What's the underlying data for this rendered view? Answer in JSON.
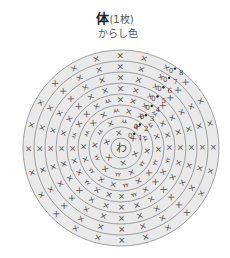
{
  "header": {
    "title": "体",
    "count": "(1枚)",
    "color_name": "からし色"
  },
  "diagram": {
    "type": "crochet-round-chart",
    "center": {
      "x": 121,
      "y": 148
    },
    "center_label": "わ",
    "center_radius": 10,
    "ring_width": 11,
    "rounds": [
      {
        "round": 1,
        "stitch_count": 6,
        "increase_symbols": 0
      },
      {
        "round": 2,
        "stitch_count": 12,
        "increase_symbols": 6
      },
      {
        "round": 3,
        "stitch_count": 18,
        "increase_symbols": 6
      },
      {
        "round": 4,
        "stitch_count": 24,
        "increase_symbols": 6
      },
      {
        "round": 5,
        "stitch_count": 24,
        "increase_symbols": 0
      },
      {
        "round": 6,
        "stitch_count": 24,
        "increase_symbols": 0
      },
      {
        "round": 7,
        "stitch_count": 24,
        "increase_symbols": 0
      },
      {
        "round": 8,
        "stitch_count": 24,
        "increase_symbols": 0
      }
    ],
    "round_labels": [
      "1",
      "2",
      "3",
      "4",
      "5",
      "6",
      "7",
      "8"
    ],
    "stitch_symbol": "×",
    "increase_symbol": "ㅆ",
    "chain_symbol": "0",
    "colors": {
      "ring_fill": "#e9e9e9",
      "ring_stroke": "#8a8a8a",
      "symbol": "#555555",
      "background": "#ffffff"
    }
  }
}
